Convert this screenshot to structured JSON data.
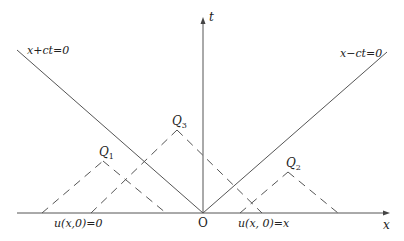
{
  "diagram": {
    "type": "characteristics-diagram",
    "axes": {
      "x_label": "x",
      "t_label": "t",
      "origin_label": "O"
    },
    "characteristic_lines": [
      {
        "label": "x+ct=0",
        "from": [
          17,
          50
        ],
        "to": [
          203,
          213
        ]
      },
      {
        "label": "x−ct=0",
        "from": [
          203,
          213
        ],
        "to": [
          387,
          52
        ]
      }
    ],
    "points": [
      {
        "name": "Q",
        "sub": "1",
        "apex": [
          103,
          161
        ],
        "left_foot": [
          42,
          213
        ],
        "right_foot": [
          166,
          213
        ]
      },
      {
        "name": "Q",
        "sub": "3",
        "apex": [
          177,
          130
        ],
        "left_foot": [
          91,
          213
        ],
        "right_foot": [
          262,
          213
        ]
      },
      {
        "name": "Q",
        "sub": "2",
        "apex": [
          288,
          172
        ],
        "left_foot": [
          240,
          213
        ],
        "right_foot": [
          338,
          213
        ]
      }
    ],
    "initial_conditions": [
      {
        "label": "u(x,0)=0"
      },
      {
        "label": "u(x, 0)=x"
      }
    ],
    "colors": {
      "line": "#555555",
      "text": "#222222",
      "background": "#ffffff"
    }
  }
}
